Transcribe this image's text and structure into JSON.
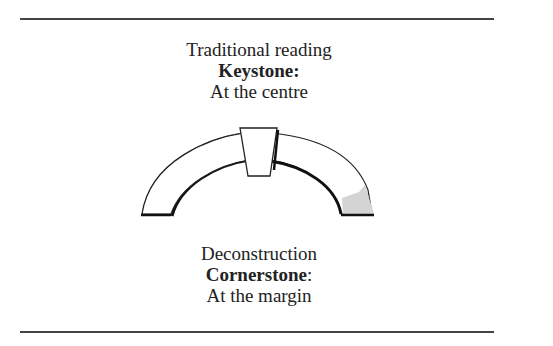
{
  "top_section": {
    "heading": "Traditional reading",
    "term": "Keystone",
    "term_punct": ":",
    "term_punct_bold": true,
    "description": "At the centre"
  },
  "bottom_section": {
    "heading": "Deconstruction",
    "term": "Cornerstone",
    "term_punct": ":",
    "term_punct_bold": false,
    "description": "At the margin"
  },
  "diagram": {
    "shapes": [
      "arch",
      "keystone-block",
      "cornerstone-block"
    ],
    "colors": {
      "arch_fill": "#ffffff",
      "outline": "#222222",
      "cornerstone_fill": "#d4d4d4",
      "rule": "#444444"
    }
  }
}
